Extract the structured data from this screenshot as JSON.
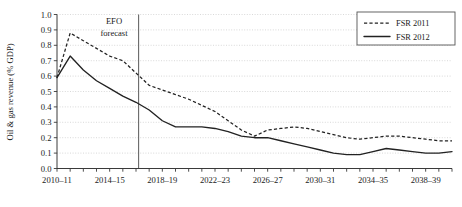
{
  "chart_data": {
    "type": "line",
    "title": "",
    "xlabel": "",
    "ylabel": "Oil & gas revenue (% GDP)",
    "ylim": [
      0.0,
      1.0
    ],
    "ytick_labels": [
      "0.0",
      "0.1",
      "0.2",
      "0.3",
      "0.4",
      "0.5",
      "0.6",
      "0.7",
      "0.8",
      "0.9",
      "1.0"
    ],
    "ytick_values": [
      0.0,
      0.1,
      0.2,
      0.3,
      0.4,
      0.5,
      0.6,
      0.7,
      0.8,
      0.9,
      1.0
    ],
    "grid": "horizontal-dotted",
    "legend_position": "top-right",
    "x": [
      "2010-11",
      "2011-12",
      "2012-13",
      "2013-14",
      "2014-15",
      "2015-16",
      "2016-17",
      "2017-18",
      "2018-19",
      "2019-20",
      "2020-21",
      "2021-22",
      "2022-23",
      "2023-24",
      "2024-25",
      "2025-26",
      "2026-27",
      "2027-28",
      "2028-29",
      "2029-30",
      "2030-31",
      "2031-32",
      "2032-33",
      "2033-34",
      "2034-35",
      "2035-36",
      "2036-37",
      "2037-38",
      "2038-39",
      "2039-40",
      "2040-41"
    ],
    "xtick_labels": [
      "2010–11",
      "2014–15",
      "2018–19",
      "2022–23",
      "2026–27",
      "2030–31",
      "2034–35",
      "2038–39"
    ],
    "xtick_indices": [
      0,
      4,
      8,
      12,
      16,
      20,
      24,
      28
    ],
    "series": [
      {
        "name": "FSR 2011",
        "style": "dashed",
        "values": [
          0.59,
          0.88,
          0.83,
          0.78,
          0.73,
          0.7,
          0.62,
          0.54,
          0.51,
          0.48,
          0.45,
          0.41,
          0.37,
          0.31,
          0.25,
          0.21,
          0.25,
          0.26,
          0.27,
          0.26,
          0.24,
          0.22,
          0.2,
          0.19,
          0.2,
          0.21,
          0.21,
          0.2,
          0.19,
          0.18,
          0.18
        ]
      },
      {
        "name": "FSR 2012",
        "style": "solid",
        "values": [
          0.59,
          0.73,
          0.64,
          0.57,
          0.52,
          0.47,
          0.43,
          0.38,
          0.31,
          0.27,
          0.27,
          0.27,
          0.26,
          0.24,
          0.21,
          0.2,
          0.2,
          0.18,
          0.16,
          0.14,
          0.12,
          0.1,
          0.09,
          0.09,
          0.11,
          0.13,
          0.12,
          0.11,
          0.1,
          0.1,
          0.11
        ]
      }
    ],
    "annotations": [
      {
        "name": "efo-forecast",
        "line1": "EFO",
        "line2": "forecast",
        "at_x_index": 6,
        "vertical_line_at_index": 6.2
      }
    ]
  },
  "legend": {
    "entries": [
      {
        "label": "FSR 2011",
        "style": "dashed"
      },
      {
        "label": "FSR 2012",
        "style": "solid"
      }
    ]
  }
}
